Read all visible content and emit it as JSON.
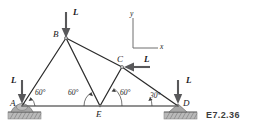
{
  "figure": {
    "id_label": "E7.2.36",
    "background_color": "#ffffff",
    "member_color": "#2b2b2b",
    "load_arrow_color": "#58585a",
    "support_color": "#9d9d9d",
    "ground_color": "#8a8a8a",
    "text_color": "#1a1a1a"
  },
  "joints": [
    {
      "name": "A",
      "label": "A",
      "x": 22,
      "y": 106,
      "label_x": 10,
      "label_y": 100
    },
    {
      "name": "B",
      "label": "B",
      "x": 66,
      "y": 38,
      "label_x": 54,
      "label_y": 32
    },
    {
      "name": "C",
      "label": "C",
      "x": 122,
      "y": 67,
      "label_x": 118,
      "label_y": 56
    },
    {
      "name": "D",
      "label": "D",
      "x": 178,
      "y": 106,
      "label_x": 183,
      "label_y": 100
    },
    {
      "name": "E",
      "label": "E",
      "x": 100,
      "y": 106,
      "label_x": 97,
      "label_y": 111
    }
  ],
  "members": [
    {
      "name": "member-AB",
      "from": "A",
      "to": "B"
    },
    {
      "name": "member-BE",
      "from": "B",
      "to": "E"
    },
    {
      "name": "member-BC",
      "from": "B",
      "to": "C"
    },
    {
      "name": "member-CD",
      "from": "C",
      "to": "D"
    },
    {
      "name": "member-EC",
      "from": "E",
      "to": "C"
    },
    {
      "name": "member-AE",
      "from": "A",
      "to": "E"
    },
    {
      "name": "member-ED",
      "from": "E",
      "to": "D"
    }
  ],
  "loads": [
    {
      "name": "load-at-B",
      "label": "L",
      "direction": "down",
      "at_joint": "B",
      "label_x": 74,
      "label_y": 9
    },
    {
      "name": "load-at-A",
      "label": "L",
      "direction": "down",
      "at_joint": "A",
      "label_x": 11,
      "label_y": 77
    },
    {
      "name": "load-at-C",
      "label": "L",
      "direction": "left",
      "at_joint": "C",
      "label_x": 145,
      "label_y": 57
    },
    {
      "name": "load-at-D",
      "label": "L",
      "direction": "down",
      "at_joint": "D",
      "label_x": 185,
      "label_y": 77
    }
  ],
  "angles": [
    {
      "name": "angle-at-A",
      "label": "60°",
      "x": 36,
      "y": 93
    },
    {
      "name": "angle-at-E-left",
      "label": "60°",
      "x": 70,
      "y": 93
    },
    {
      "name": "angle-at-E-right",
      "label": "60°",
      "x": 112,
      "y": 93
    },
    {
      "name": "angle-at-D",
      "label": "30°",
      "x": 142,
      "y": 95
    }
  ],
  "axes": {
    "origin_x": 133,
    "origin_y": 48,
    "y_label": "y",
    "x_label": "x",
    "y_label_x": 130,
    "y_label_y": 12,
    "x_label_x": 161,
    "x_label_y": 46
  },
  "supports": [
    {
      "name": "support-at-A",
      "type": "pin-rounded",
      "at_joint": "A"
    },
    {
      "name": "support-at-D",
      "type": "pin-triangular",
      "at_joint": "D"
    }
  ]
}
